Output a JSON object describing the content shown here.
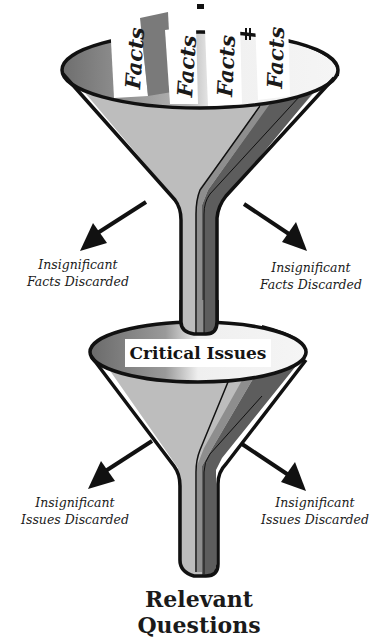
{
  "diagram": {
    "type": "double-funnel",
    "top_funnel": {
      "inputs": [
        "Facts",
        "Facts",
        "Facts",
        "Facts"
      ],
      "left_discard": {
        "line1": "Insignificant",
        "line2": "Facts Discarded"
      },
      "right_discard": {
        "line1": "Insignificant",
        "line2": "Facts Discarded"
      }
    },
    "bottom_funnel": {
      "input": "Critical Issues",
      "left_discard": {
        "line1": "Insignificant",
        "line2": "Issues Discarded"
      },
      "right_discard": {
        "line1": "Insignificant",
        "line2": "Issues Discarded"
      }
    },
    "output": {
      "line1": "Relevant",
      "line2": "Questions"
    },
    "icons": {
      "funnel": "funnel-icon",
      "arrow": "arrow-down-left-icon / arrow-down-right-icon"
    },
    "colors": {
      "outline": "#111111",
      "funnel_light": "#bdbdbd",
      "funnel_mid": "#8c8c8c",
      "funnel_dark": "#5a5a5a",
      "rim_inside": "#f2f2f2",
      "background": "#ffffff"
    }
  }
}
